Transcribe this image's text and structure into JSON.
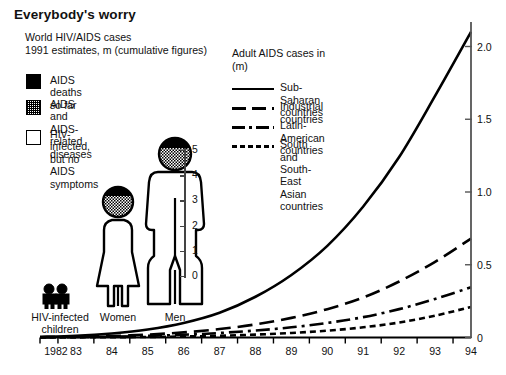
{
  "headline": "Everybody's worry",
  "subhead": "World HIV/AIDS cases\n1991 estimates, m (cumulative figures)",
  "swatch_legend": [
    {
      "pattern": "black",
      "label": "AIDS deaths so far"
    },
    {
      "pattern": "stipple",
      "label": "AIDS and AIDS-related\ndiseases"
    },
    {
      "pattern": "white",
      "label": "HIV-infected, but no\nAIDS symptoms"
    }
  ],
  "line_legend": {
    "title": "Adult AIDS cases in\n(m)",
    "items": [
      {
        "style": "solid",
        "label": "Sub-Saharan countries"
      },
      {
        "style": "dash",
        "label": "Industrial countries"
      },
      {
        "style": "dashdot",
        "label": "Latin-American countries"
      },
      {
        "style": "dots",
        "label": "South and South-East\nAsian countries"
      }
    ]
  },
  "pictograms": [
    {
      "name": "children",
      "caption": "HIV-infected\nchildren",
      "value": 1.0
    },
    {
      "name": "women",
      "caption": "Women",
      "value": 3.0
    },
    {
      "name": "men",
      "caption": "Men",
      "value": 5.0
    }
  ],
  "inner_axis": {
    "ticks": [
      "0",
      "1",
      "2",
      "3",
      "4",
      "5"
    ],
    "min": 0,
    "max": 5
  },
  "chart_data": {
    "type": "line",
    "title": "Everybody's worry",
    "subtitle": "Adult AIDS cases in (m)",
    "xlabel": "",
    "ylabel": "m",
    "x": [
      "1982",
      "83",
      "84",
      "85",
      "86",
      "87",
      "88",
      "89",
      "90",
      "91",
      "92",
      "93",
      "94"
    ],
    "xtick_labels": [
      "1982",
      "83",
      "84",
      "85",
      "86",
      "87",
      "88",
      "89",
      "90",
      "91",
      "92",
      "93",
      "94"
    ],
    "ytick_labels": [
      "0",
      "0.5",
      "1.0",
      "1.5",
      "2.0"
    ],
    "ytick_values": [
      0,
      0.5,
      1.0,
      1.5,
      2.0
    ],
    "ylim": [
      0,
      2.25
    ],
    "grid": false,
    "legend_position": "top-right",
    "series": [
      {
        "name": "Sub-Saharan countries",
        "style": "solid",
        "values": [
          0.005,
          0.012,
          0.028,
          0.055,
          0.1,
          0.17,
          0.28,
          0.43,
          0.63,
          0.9,
          1.24,
          1.66,
          2.1
        ]
      },
      {
        "name": "Industrial countries",
        "style": "dash",
        "values": [
          0.002,
          0.005,
          0.01,
          0.02,
          0.035,
          0.058,
          0.09,
          0.135,
          0.195,
          0.275,
          0.385,
          0.52,
          0.68
        ]
      },
      {
        "name": "Latin-American countries",
        "style": "dashdot",
        "values": [
          0.001,
          0.003,
          0.006,
          0.011,
          0.019,
          0.031,
          0.048,
          0.07,
          0.1,
          0.14,
          0.195,
          0.265,
          0.345
        ]
      },
      {
        "name": "South and South-East Asian countries",
        "style": "dots",
        "values": [
          0.0,
          0.001,
          0.002,
          0.004,
          0.007,
          0.012,
          0.02,
          0.031,
          0.047,
          0.07,
          0.103,
          0.15,
          0.21
        ]
      }
    ]
  }
}
